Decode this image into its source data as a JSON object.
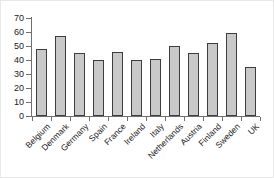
{
  "chart_data": {
    "type": "bar",
    "title": "",
    "subtitle": "",
    "xlabel": "",
    "ylabel": "",
    "categories": [
      "Belgium",
      "Denmark",
      "Germany",
      "Spain",
      "France",
      "Ireland",
      "Italy",
      "Netherlands",
      "Austria",
      "Finland",
      "Sweden",
      "UK"
    ],
    "values": [
      48,
      57,
      45,
      40,
      46,
      40,
      41,
      50,
      45,
      52,
      59,
      35
    ],
    "ylim": [
      0,
      70
    ],
    "y_ticks": [
      0,
      10,
      20,
      30,
      40,
      50,
      60,
      70
    ],
    "y_tick_labels": [
      "0",
      "10",
      "20",
      "30",
      "40",
      "50",
      "60",
      "70"
    ],
    "grid": false,
    "legend": null,
    "legend_position": "none",
    "annotations": [],
    "bar_fill_color": "#c9c9c9",
    "bar_edge_color": "#3d3d3d",
    "axis_color": "#707070",
    "background_color": "#ffffff",
    "x_tick_label_rotation": 45
  }
}
